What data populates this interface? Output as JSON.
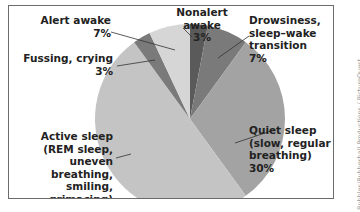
{
  "chart_data": {
    "type": "pie",
    "title": "",
    "start_angle": "12 o'clock, clockwise",
    "slices": [
      {
        "label": "Nonalert awake",
        "value": 3,
        "color": "#5a5a5a"
      },
      {
        "label": "Drowsiness, sleep–wake transition",
        "value": 7,
        "color": "#7a7a7a"
      },
      {
        "label": "Quiet sleep (slow, regular breathing)",
        "value": 30,
        "color": "#a3a3a3"
      },
      {
        "label": "Active sleep (REM sleep, uneven breathing, smiling, grimacing)",
        "value": 50,
        "color": "#c4c4c4"
      },
      {
        "label": "Fussing, crying",
        "value": 3,
        "color": "#7a7a7a"
      },
      {
        "label": "Alert awake",
        "value": 7,
        "color": "#d6d6d6"
      }
    ]
  },
  "labels": {
    "nonalert": {
      "name": "Nonalert awake",
      "pct": "3%"
    },
    "drowsiness": {
      "line1": "Drowsiness,",
      "line2": "sleep–wake",
      "line3": "transition",
      "pct": "7%"
    },
    "quiet": {
      "line1": "Quiet sleep",
      "line2": "(slow, regular",
      "line3": "breathing)",
      "pct": "30%"
    },
    "active": {
      "line1": "Active sleep",
      "line2": "(REM sleep,",
      "line3": "uneven breathing,",
      "line4": "smiling, grimacing)",
      "pct": "50%"
    },
    "fussing": {
      "name": "Fussing, crying",
      "pct": "3%"
    },
    "alert": {
      "name": "Alert awake",
      "pct": "7%"
    }
  },
  "credit": "Bubbles/Rubberball Productions / PictureQuest"
}
